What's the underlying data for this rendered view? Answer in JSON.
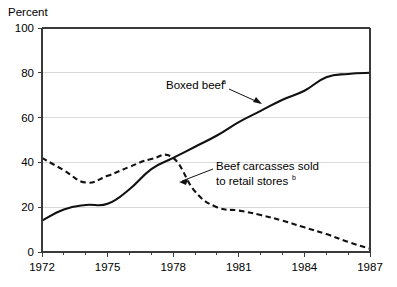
{
  "chart_data": {
    "type": "line",
    "title": "",
    "xlabel": "",
    "ylabel": "Percent",
    "xlim": [
      1972,
      1987
    ],
    "ylim": [
      0,
      100
    ],
    "grid": true,
    "legend_position": "inline-annotations",
    "x": [
      1972,
      1973,
      1974,
      1975,
      1976,
      1977,
      1978,
      1979,
      1980,
      1981,
      1982,
      1983,
      1984,
      1985,
      1986,
      1987
    ],
    "xticks": [
      1972,
      1975,
      1978,
      1981,
      1984,
      1987
    ],
    "xticklabels": [
      "1972",
      "1975",
      "1978",
      "1981",
      "1984",
      "1987"
    ],
    "yticks": [
      0,
      20,
      40,
      60,
      80,
      100
    ],
    "yticklabels": [
      "0",
      "20",
      "40",
      "60",
      "80",
      "100"
    ],
    "series": [
      {
        "name": "Boxed beef",
        "name_superscript": "a",
        "style": "solid",
        "values": [
          14,
          19,
          21,
          21.5,
          28,
          37,
          42,
          47,
          52,
          58,
          63,
          68,
          72,
          78,
          79.5,
          80
        ]
      },
      {
        "name": "Beef carcasses sold to retail stores",
        "name_superscript": "b",
        "style": "dashed",
        "values": [
          42,
          36.5,
          31,
          34,
          38,
          41.5,
          42,
          27,
          20,
          18.5,
          16.5,
          14,
          11,
          8,
          4.5,
          1.5
        ]
      }
    ],
    "annotations": [
      {
        "id": "boxed-beef",
        "text": "Boxed beef",
        "superscript": "a",
        "points_to_series": "Boxed beef"
      },
      {
        "id": "beef-carcasses",
        "text_line1": "Beef carcasses sold",
        "text_line2": "to retail stores",
        "superscript": "b",
        "points_to_series": "Beef carcasses sold to retail stores"
      }
    ]
  },
  "axes": {
    "y_title": "Percent"
  },
  "colors": {
    "line": "#111111",
    "grid": "#d9d9d9",
    "axis": "#3a3a3a",
    "background": "#ffffff"
  }
}
